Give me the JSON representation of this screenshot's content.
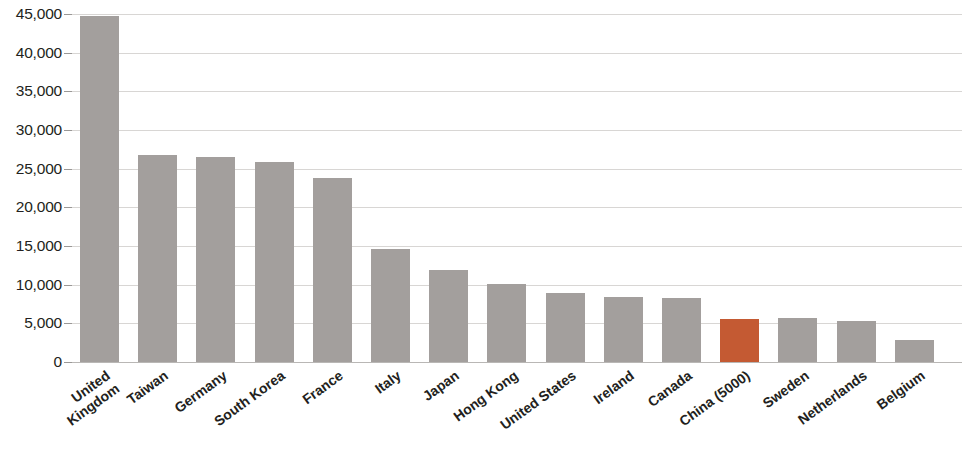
{
  "chart_data": {
    "type": "bar",
    "title": "",
    "subtitle": "",
    "xlabel": "",
    "ylabel": "",
    "ylim": [
      0,
      45000
    ],
    "yticks": [
      0,
      5000,
      10000,
      15000,
      20000,
      25000,
      30000,
      35000,
      40000,
      45000
    ],
    "ytick_labels": [
      "0",
      "5,000",
      "10,000",
      "15,000",
      "20,000",
      "25,000",
      "30,000",
      "35,000",
      "40,000",
      "45,000"
    ],
    "grid": true,
    "legend": "none",
    "categories": [
      "United Kingdom",
      "Taiwan",
      "Germany",
      "South Korea",
      "France",
      "Italy",
      "Japan",
      "Hong Kong",
      "United States",
      "Ireland",
      "Canada",
      "China (5000)",
      "Sweden",
      "Netherlands",
      "Belgium"
    ],
    "category_lines": [
      [
        "United",
        "Kingdom"
      ],
      [
        "Taiwan"
      ],
      [
        "Germany"
      ],
      [
        "South Korea"
      ],
      [
        "France"
      ],
      [
        "Italy"
      ],
      [
        "Japan"
      ],
      [
        "Hong Kong"
      ],
      [
        "United States"
      ],
      [
        "Ireland"
      ],
      [
        "Canada"
      ],
      [
        "China (5000)"
      ],
      [
        "Sweden"
      ],
      [
        "Netherlands"
      ],
      [
        "Belgium"
      ]
    ],
    "values": [
      44800,
      26800,
      26500,
      25800,
      23800,
      14600,
      11900,
      10100,
      8900,
      8400,
      8300,
      5600,
      5700,
      5300,
      2900
    ],
    "bar_colors": [
      "#a39f9d",
      "#a39f9d",
      "#a39f9d",
      "#a39f9d",
      "#a39f9d",
      "#a39f9d",
      "#a39f9d",
      "#a39f9d",
      "#a39f9d",
      "#a39f9d",
      "#a39f9d",
      "#c45a33",
      "#a39f9d",
      "#a39f9d",
      "#a39f9d"
    ],
    "highlight_index": 11,
    "colors": {
      "bar_default": "#a39f9d",
      "bar_highlight": "#c45a33",
      "gridline": "#d8d6d4",
      "axis": "#b9b7b5",
      "text": "#231f20",
      "background": "#ffffff"
    }
  }
}
